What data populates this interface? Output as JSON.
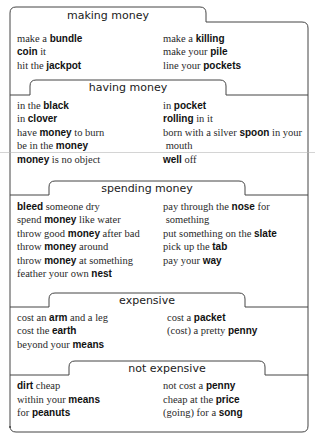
{
  "sections": [
    {
      "heading": "making money",
      "heading_pos": [
        108,
        10
      ],
      "rows": [
        {
          "y": 33,
          "left": [
            [
              "make a ",
              false
            ],
            [
              "bundle",
              true
            ]
          ],
          "right": [
            [
              "make a ",
              false
            ],
            [
              "killing",
              true
            ]
          ]
        },
        {
          "y": 46,
          "left": [
            [
              "coin",
              true
            ],
            [
              " it",
              false
            ]
          ],
          "right": [
            [
              "make your ",
              false
            ],
            [
              "pile",
              true
            ]
          ]
        },
        {
          "y": 60,
          "left": [
            [
              "hit the ",
              false
            ],
            [
              "jackpot",
              true
            ]
          ],
          "right": [
            [
              "line your ",
              false
            ],
            [
              "pockets",
              true
            ]
          ]
        }
      ]
    },
    {
      "heading": "having money",
      "heading_pos": [
        128,
        82
      ],
      "rows": [
        {
          "y": 100,
          "left": [
            [
              "in the ",
              false
            ],
            [
              "black",
              true
            ]
          ],
          "right": [
            [
              "in ",
              false
            ],
            [
              "pocket",
              true
            ]
          ]
        },
        {
          "y": 113,
          "left": [
            [
              "in ",
              false
            ],
            [
              "clover",
              true
            ]
          ],
          "right": [
            [
              "rolling",
              true
            ],
            [
              " in it",
              false
            ]
          ]
        },
        {
          "y": 127,
          "left": [
            [
              "have ",
              false
            ],
            [
              "money",
              true
            ],
            [
              " to burn",
              false
            ]
          ],
          "right": [
            [
              "born with a silver ",
              false
            ],
            [
              "spoon",
              true
            ],
            [
              " in your",
              false
            ]
          ]
        },
        {
          "y": 140,
          "left": [
            [
              "be in the ",
              false
            ],
            [
              "money",
              true
            ]
          ],
          "right": [
            [
              " mouth",
              false
            ]
          ]
        },
        {
          "y": 154,
          "left": [
            [
              "money",
              true
            ],
            [
              " is no object",
              false
            ]
          ],
          "right": [
            [
              "well",
              true
            ],
            [
              " off",
              false
            ]
          ]
        }
      ]
    },
    {
      "heading": "spending money",
      "heading_pos": [
        147,
        183
      ],
      "rows": [
        {
          "y": 201,
          "left": [
            [
              "bleed",
              true
            ],
            [
              " someone dry",
              false
            ]
          ],
          "right": [
            [
              "pay through the ",
              false
            ],
            [
              "nose",
              true
            ],
            [
              " for",
              false
            ]
          ]
        },
        {
          "y": 214,
          "left": [
            [
              "spend ",
              false
            ],
            [
              "money",
              true
            ],
            [
              " like water",
              false
            ]
          ],
          "right": [
            [
              " something",
              false
            ]
          ]
        },
        {
          "y": 228,
          "left": [
            [
              "throw good ",
              false
            ],
            [
              "money",
              true
            ],
            [
              " after bad",
              false
            ]
          ],
          "right": [
            [
              "put something on the ",
              false
            ],
            [
              "slate",
              true
            ]
          ]
        },
        {
          "y": 241,
          "left": [
            [
              "throw ",
              false
            ],
            [
              "money",
              true
            ],
            [
              " around",
              false
            ]
          ],
          "right": [
            [
              "pick up the ",
              false
            ],
            [
              "tab",
              true
            ]
          ]
        },
        {
          "y": 255,
          "left": [
            [
              "throw ",
              false
            ],
            [
              "money",
              true
            ],
            [
              " at something",
              false
            ]
          ],
          "right": [
            [
              "pay your ",
              false
            ],
            [
              "way",
              true
            ]
          ]
        },
        {
          "y": 268,
          "left": [
            [
              "feather your own ",
              false
            ],
            [
              "nest",
              true
            ]
          ],
          "right": []
        }
      ]
    },
    {
      "heading": "expensive",
      "heading_pos": [
        147,
        295
      ],
      "rows": [
        {
          "y": 312,
          "left": [
            [
              "cost an ",
              false
            ],
            [
              "arm",
              true
            ],
            [
              " and a leg",
              false
            ]
          ],
          "right": [
            [
              "cost a ",
              false
            ],
            [
              "packet",
              true
            ]
          ]
        },
        {
          "y": 325,
          "left": [
            [
              "cost the ",
              false
            ],
            [
              "earth",
              true
            ]
          ],
          "right": [
            [
              "(cost) a pretty ",
              false
            ],
            [
              "penny",
              true
            ]
          ]
        },
        {
          "y": 339,
          "left": [
            [
              "beyond your ",
              false
            ],
            [
              "means",
              true
            ]
          ],
          "right": []
        }
      ]
    },
    {
      "heading": "not expensive",
      "heading_pos": [
        167,
        363
      ],
      "rows": [
        {
          "y": 380,
          "left": [
            [
              "dirt",
              true
            ],
            [
              " cheap",
              false
            ]
          ],
          "right": [
            [
              "not cost a ",
              false
            ],
            [
              "penny",
              true
            ]
          ]
        },
        {
          "y": 394,
          "left": [
            [
              "within your ",
              false
            ],
            [
              "means",
              true
            ]
          ],
          "right": [
            [
              "cheap at the ",
              false
            ],
            [
              "price",
              true
            ]
          ]
        },
        {
          "y": 407,
          "left": [
            [
              "for ",
              false
            ],
            [
              "peanuts",
              true
            ]
          ],
          "right": [
            [
              "(going) for a ",
              false
            ],
            [
              "song",
              true
            ]
          ]
        }
      ]
    }
  ],
  "layout": {
    "left_col_x": 17,
    "right_col_x": 163,
    "right_col_x_s4": 167,
    "border_color": "#3a3a3a"
  }
}
